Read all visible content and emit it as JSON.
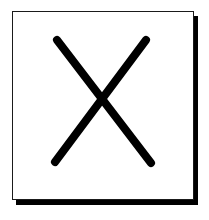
{
  "icon": {
    "name": "close-x",
    "description": "X mark in a bordered box with drop shadow",
    "colors": {
      "background": "#ffffff",
      "border": "#1a1a1a",
      "stroke": "#000000",
      "shadow": "#000000"
    },
    "stroke_width": 8,
    "strokes": [
      {
        "x1": 57,
        "y1": 40,
        "x2": 151,
        "y2": 163
      },
      {
        "x1": 146,
        "y1": 40,
        "x2": 55,
        "y2": 162
      }
    ]
  }
}
